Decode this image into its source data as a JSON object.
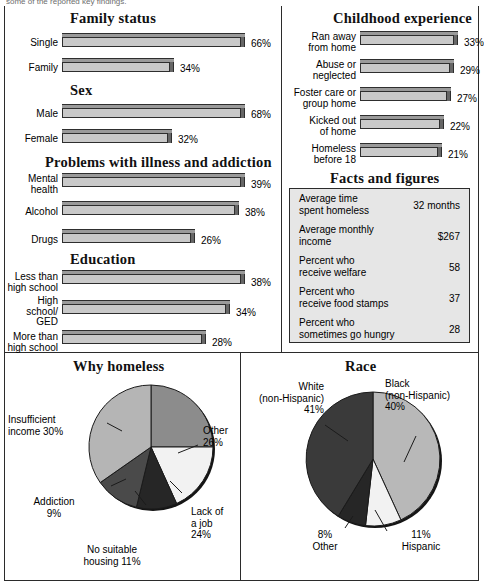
{
  "top_cut_text": "some of the reported key findings.",
  "colors": {
    "bar_face": "#c9c9c9",
    "bar_top": "#9a9a9a",
    "bar_side": "#666666",
    "outline": "#2b2b2b",
    "facts_bg": "#e6e6e6",
    "pie_light": "#f2f2f2",
    "pie_lightgray": "#c2c2c2",
    "pie_midgray": "#8c8c8c",
    "pie_gray": "#b5b5b5",
    "pie_dark": "#3a3a3a",
    "pie_darkest": "#262626"
  },
  "sections": {
    "family_status": {
      "title": "Family status",
      "rows": [
        {
          "label": "Single",
          "value": 66,
          "display": "66%",
          "barlen": 183
        },
        {
          "label": "Family",
          "value": 34,
          "display": "34%",
          "barlen": 112
        }
      ]
    },
    "sex": {
      "title": "Sex",
      "rows": [
        {
          "label": "Male",
          "value": 68,
          "display": "68%",
          "barlen": 183
        },
        {
          "label": "Female",
          "value": 32,
          "display": "32%",
          "barlen": 110
        }
      ]
    },
    "problems": {
      "title": "Problems with illness and addiction",
      "rows": [
        {
          "label": "Mental\nhealth",
          "value": 39,
          "display": "39%",
          "barlen": 183
        },
        {
          "label": "Alcohol",
          "value": 38,
          "display": "38%",
          "barlen": 177
        },
        {
          "label": "Drugs",
          "value": 26,
          "display": "26%",
          "barlen": 133
        }
      ]
    },
    "education": {
      "title": "Education",
      "rows": [
        {
          "label": "Less than\nhigh school",
          "value": 38,
          "display": "38%",
          "barlen": 183
        },
        {
          "label": "High school/\nGED",
          "value": 34,
          "display": "34%",
          "barlen": 168
        },
        {
          "label": "More than\nhigh school",
          "value": 28,
          "display": "28%",
          "barlen": 144
        }
      ]
    },
    "childhood": {
      "title": "Childhood experience",
      "rows": [
        {
          "label": "Ran away\nfrom home",
          "value": 33,
          "display": "33%",
          "barlen": 98
        },
        {
          "label": "Abuse or\nneglected",
          "value": 29,
          "display": "29%",
          "barlen": 94
        },
        {
          "label": "Foster care or\ngroup home",
          "value": 27,
          "display": "27%",
          "barlen": 91
        },
        {
          "label": "Kicked out\nof home",
          "value": 22,
          "display": "22%",
          "barlen": 84
        },
        {
          "label": "Homeless\nbefore 18",
          "value": 21,
          "display": "21%",
          "barlen": 82
        }
      ]
    }
  },
  "facts": {
    "title": "Facts and figures",
    "rows": [
      {
        "label": "Average time\nspent homeless",
        "value": "32 months"
      },
      {
        "label": "Average monthly\nincome",
        "value": "$267"
      },
      {
        "label": "Percent who\nreceive welfare",
        "value": "58"
      },
      {
        "label": "Percent who\nreceive food stamps",
        "value": "37"
      },
      {
        "label": "Percent who\nsometimes go hungry",
        "value": "28"
      }
    ]
  },
  "chart_data": [
    {
      "type": "bar",
      "title": "Family status",
      "categories": [
        "Single",
        "Family"
      ],
      "values": [
        66,
        34
      ],
      "xlabel": "",
      "ylabel": "Percent",
      "ylim": [
        0,
        100
      ]
    },
    {
      "type": "bar",
      "title": "Sex",
      "categories": [
        "Male",
        "Female"
      ],
      "values": [
        68,
        32
      ],
      "xlabel": "",
      "ylabel": "Percent",
      "ylim": [
        0,
        100
      ]
    },
    {
      "type": "bar",
      "title": "Problems with illness and addiction",
      "categories": [
        "Mental health",
        "Alcohol",
        "Drugs"
      ],
      "values": [
        39,
        38,
        26
      ],
      "xlabel": "",
      "ylabel": "Percent",
      "ylim": [
        0,
        100
      ]
    },
    {
      "type": "bar",
      "title": "Education",
      "categories": [
        "Less than high school",
        "High school/GED",
        "More than high school"
      ],
      "values": [
        38,
        34,
        28
      ],
      "xlabel": "",
      "ylabel": "Percent",
      "ylim": [
        0,
        100
      ]
    },
    {
      "type": "bar",
      "title": "Childhood experience",
      "categories": [
        "Ran away from home",
        "Abuse or neglected",
        "Foster care or group home",
        "Kicked out of home",
        "Homeless before 18"
      ],
      "values": [
        33,
        29,
        27,
        22,
        21
      ],
      "xlabel": "",
      "ylabel": "Percent",
      "ylim": [
        0,
        100
      ]
    },
    {
      "type": "pie",
      "title": "Why homeless",
      "categories": [
        "Other",
        "Lack of a job",
        "No suitable housing",
        "Addiction",
        "Insufficient income"
      ],
      "values": [
        26,
        24,
        11,
        9,
        30
      ],
      "labels": [
        "Other\n26%",
        "Lack of\na job\n24%",
        "No suitable\nhousing 11%",
        "Addiction\n9%",
        "Insufficient\nincome 30%"
      ],
      "slice_colors": [
        "#8c8c8c",
        "#f2f2f2",
        "#262626",
        "#4a4a4a",
        "#b5b5b5"
      ],
      "legend": "none"
    },
    {
      "type": "pie",
      "title": "Race",
      "categories": [
        "Black (non-Hispanic)",
        "Hispanic",
        "Other",
        "White (non-Hispanic)"
      ],
      "values": [
        40,
        11,
        8,
        41
      ],
      "labels": [
        "Black\n(non-Hispanic)\n40%",
        "11%\nHispanic",
        "8%\nOther",
        "White\n(non-Hispanic)\n41%"
      ],
      "slice_colors": [
        "#b8b8b8",
        "#f2f2f2",
        "#262626",
        "#3a3a3a"
      ],
      "legend": "none"
    }
  ],
  "pies": {
    "why_homeless": {
      "title": "Why homeless",
      "labels": {
        "other": "Other\n26%",
        "lack_job": "Lack of\na job\n24%",
        "no_housing": "No suitable\nhousing 11%",
        "addiction": "Addiction\n9%",
        "insufficient": "Insufficient\nincome 30%"
      }
    },
    "race": {
      "title": "Race",
      "labels": {
        "black": "Black\n(non-Hispanic)\n40%",
        "hispanic": "11%\nHispanic",
        "other": "8%\nOther",
        "white": "White\n(non-Hispanic)\n41%"
      }
    }
  }
}
